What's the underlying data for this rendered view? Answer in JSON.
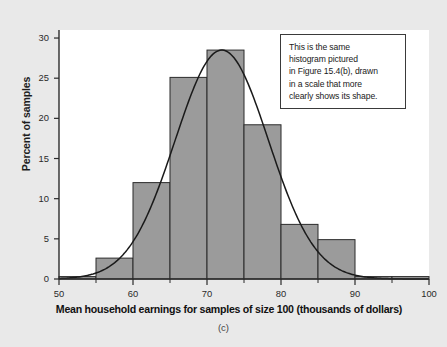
{
  "figure": {
    "panel_caption": "(c)",
    "background_color": "#e9e9e9",
    "plot_background_color": "#ffffff"
  },
  "annotation": {
    "lines": [
      "This is the same",
      "histogram pictured",
      "in Figure 15.4(b), drawn",
      "in a scale that more",
      "clearly shows its shape."
    ],
    "text": "This is the same histogram pictured in Figure 15.4(b), drawn in a scale that more clearly shows its shape."
  },
  "chart_data": {
    "type": "bar",
    "title": "",
    "subtitle": "",
    "xlabel": "Mean household earnings for samples of size 100 (thousands of dollars)",
    "ylabel": "Percent of samples",
    "xlim": [
      50,
      100
    ],
    "ylim": [
      0,
      31
    ],
    "xticks": [
      50,
      60,
      70,
      80,
      90,
      100
    ],
    "xtick_labels": [
      "50",
      "60",
      "70",
      "80",
      "90",
      "100"
    ],
    "xminor_ticks": [
      55,
      65,
      75,
      85,
      95
    ],
    "yticks": [
      0,
      5,
      10,
      15,
      20,
      25,
      30
    ],
    "ytick_labels": [
      "0",
      "5",
      "10",
      "15",
      "20",
      "25",
      "30"
    ],
    "grid": false,
    "legend": "none",
    "bar_fill_color": "#9b9b9b",
    "bar_edge_color": "#2b2b2b",
    "curve_color": "#1a1a1a",
    "bin_width": 5,
    "bin_edges": [
      50,
      55,
      60,
      65,
      70,
      75,
      80,
      85,
      90,
      95,
      100
    ],
    "categories": [
      "50-55",
      "55-60",
      "60-65",
      "65-70",
      "70-75",
      "75-80",
      "80-85",
      "85-90",
      "90-95",
      "95-100"
    ],
    "values": [
      0.3,
      2.6,
      12.0,
      25.1,
      28.5,
      19.2,
      6.8,
      4.9,
      0.3,
      0.3
    ],
    "overlay_curve": {
      "name": "normal density curve",
      "mean": 72,
      "sd": 6.3,
      "peak_percent": 28.5
    }
  }
}
